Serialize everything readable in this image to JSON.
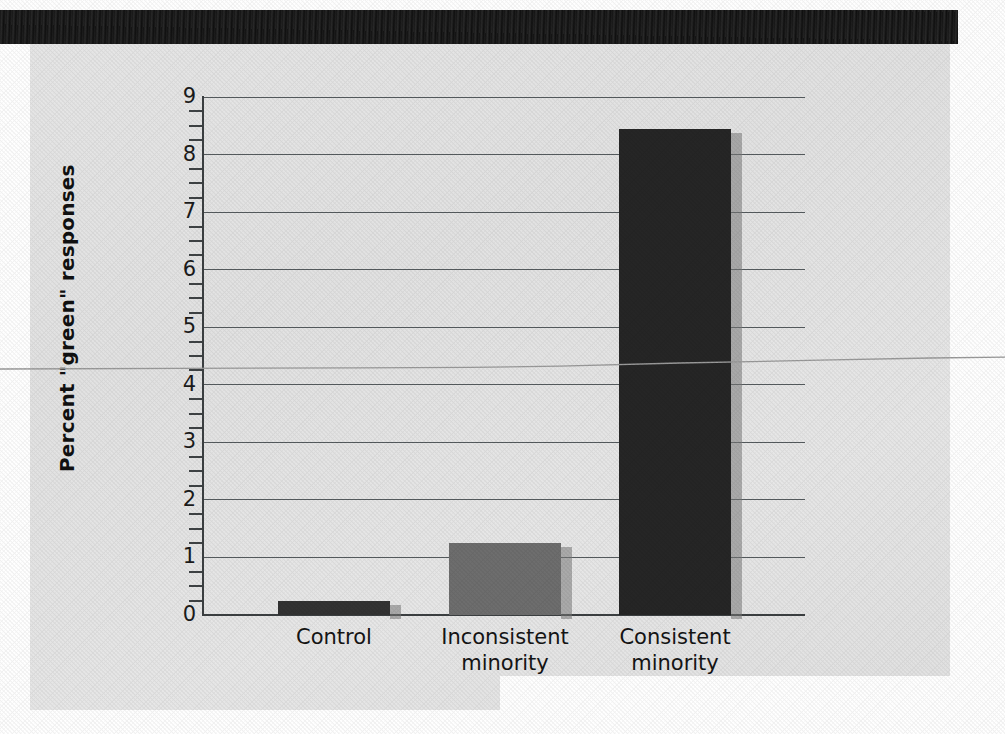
{
  "page": {
    "background_color": "#e6e6e6",
    "paper_color": "#e6e6e6",
    "header_band_color": "#1a1a1a"
  },
  "chart_data": {
    "type": "bar",
    "title": "",
    "xlabel": "",
    "ylabel": "Percent \"green\" responses",
    "categories": [
      "Control",
      "Inconsistent minority",
      "Consistent minority"
    ],
    "category_lines": [
      [
        "Control"
      ],
      [
        "Inconsistent",
        "minority"
      ],
      [
        "Consistent",
        "minority"
      ]
    ],
    "values": [
      0.25,
      1.25,
      8.45
    ],
    "bar_colors": [
      "#333333",
      "#6e6e6e",
      "#262626"
    ],
    "ylim": [
      0,
      9
    ],
    "y_ticks": [
      0,
      1,
      2,
      3,
      4,
      5,
      6,
      7,
      8,
      9
    ],
    "y_tick_labels": [
      "0",
      "1",
      "2",
      "3",
      "4",
      "5",
      "6",
      "7",
      "8",
      "9"
    ],
    "y_minor_ticks_per_interval": 3,
    "grid": "horizontal",
    "legend": "none",
    "axis_color": "#3c4042",
    "gridline_color": "#555b5e"
  },
  "y_axis": {
    "label": "Percent \"green\" responses",
    "labels": [
      "9",
      "8",
      "7",
      "6",
      "5",
      "4",
      "3",
      "2",
      "1",
      "0"
    ]
  },
  "x_axis": {
    "labels": [
      {
        "line1": "Control",
        "line2": ""
      },
      {
        "line1": "Inconsistent",
        "line2": "minority"
      },
      {
        "line1": "Consistent",
        "line2": "minority"
      }
    ]
  }
}
